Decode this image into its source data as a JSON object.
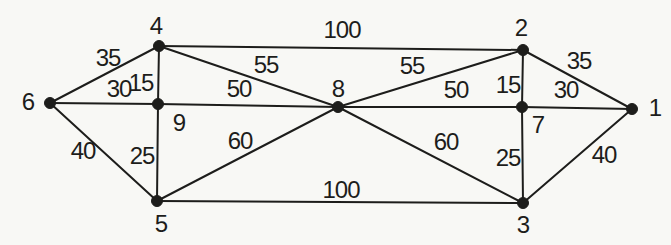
{
  "figure": {
    "title": "",
    "paper_color": "#f8f8f5",
    "ink_color": "#1d1d1b"
  },
  "chart_data": {
    "type": "graph",
    "node_count": 9,
    "edge_count": 18,
    "nodes": [
      {
        "id": "6",
        "label": "6",
        "x": 50,
        "y": 103,
        "label_x": 28,
        "label_y": 101
      },
      {
        "id": "4",
        "label": "4",
        "x": 159,
        "y": 46,
        "label_x": 156,
        "label_y": 25
      },
      {
        "id": "9",
        "label": "9",
        "x": 158,
        "y": 104,
        "label_x": 179,
        "label_y": 122
      },
      {
        "id": "5",
        "label": "5",
        "x": 157,
        "y": 201,
        "label_x": 161,
        "label_y": 223
      },
      {
        "id": "8",
        "label": "8",
        "x": 338,
        "y": 107,
        "label_x": 338,
        "label_y": 88
      },
      {
        "id": "2",
        "label": "2",
        "x": 523,
        "y": 50,
        "label_x": 521,
        "label_y": 27
      },
      {
        "id": "7",
        "label": "7",
        "x": 522,
        "y": 107,
        "label_x": 538,
        "label_y": 124
      },
      {
        "id": "3",
        "label": "3",
        "x": 523,
        "y": 203,
        "label_x": 523,
        "label_y": 224
      },
      {
        "id": "1",
        "label": "1",
        "x": 632,
        "y": 109,
        "label_x": 655,
        "label_y": 107
      }
    ],
    "edges": [
      {
        "from": "6",
        "to": "4",
        "weight": "35",
        "weight_x": 108,
        "weight_y": 57
      },
      {
        "from": "6",
        "to": "9",
        "weight": "30",
        "weight_x": 119,
        "weight_y": 88
      },
      {
        "from": "6",
        "to": "5",
        "weight": "40",
        "weight_x": 83,
        "weight_y": 150
      },
      {
        "from": "4",
        "to": "9",
        "weight": "15",
        "weight_x": 141,
        "weight_y": 82
      },
      {
        "from": "4",
        "to": "8",
        "weight": "55",
        "weight_x": 266,
        "weight_y": 64
      },
      {
        "from": "4",
        "to": "2",
        "weight": "100",
        "weight_x": 342,
        "weight_y": 29
      },
      {
        "from": "9",
        "to": "8",
        "weight": "50",
        "weight_x": 239,
        "weight_y": 88
      },
      {
        "from": "9",
        "to": "5",
        "weight": "25",
        "weight_x": 142,
        "weight_y": 155
      },
      {
        "from": "5",
        "to": "8",
        "weight": "60",
        "weight_x": 240,
        "weight_y": 140
      },
      {
        "from": "5",
        "to": "3",
        "weight": "100",
        "weight_x": 341,
        "weight_y": 189
      },
      {
        "from": "8",
        "to": "2",
        "weight": "55",
        "weight_x": 412,
        "weight_y": 65
      },
      {
        "from": "8",
        "to": "7",
        "weight": "50",
        "weight_x": 456,
        "weight_y": 89
      },
      {
        "from": "8",
        "to": "3",
        "weight": "60",
        "weight_x": 446,
        "weight_y": 141
      },
      {
        "from": "2",
        "to": "7",
        "weight": "15",
        "weight_x": 508,
        "weight_y": 84
      },
      {
        "from": "2",
        "to": "1",
        "weight": "35",
        "weight_x": 579,
        "weight_y": 60
      },
      {
        "from": "7",
        "to": "1",
        "weight": "30",
        "weight_x": 566,
        "weight_y": 89
      },
      {
        "from": "7",
        "to": "3",
        "weight": "25",
        "weight_x": 508,
        "weight_y": 157
      },
      {
        "from": "3",
        "to": "1",
        "weight": "40",
        "weight_x": 604,
        "weight_y": 154
      }
    ]
  }
}
